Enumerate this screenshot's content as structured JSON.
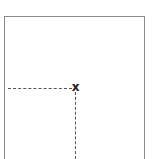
{
  "diagram": {
    "marker": {
      "glyph": "x",
      "x": 75,
      "y": 88,
      "color": "#222222"
    },
    "frame_color": "#8a8a8a",
    "guide_color": "#555555",
    "guides": {
      "horizontal": {
        "from_x": 8,
        "to_x": 72,
        "y": 88,
        "style": "dashed"
      },
      "vertical": {
        "x": 75,
        "from_y": 92,
        "to_y": 159,
        "style": "dashed"
      }
    }
  }
}
